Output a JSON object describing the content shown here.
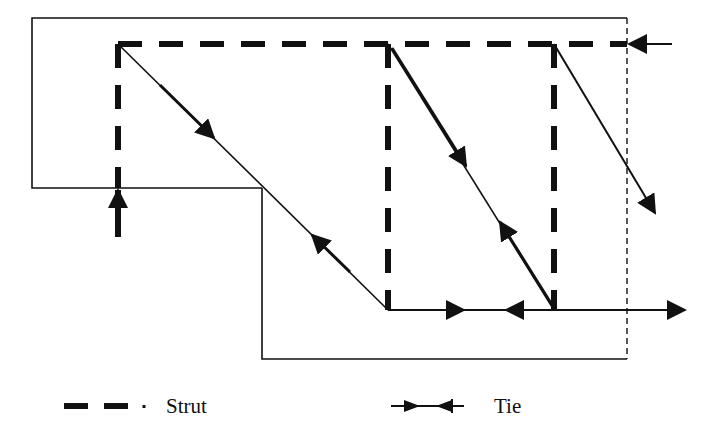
{
  "diagram": {
    "type": "strut-and-tie model",
    "colors": {
      "line": "#111111",
      "background": "#ffffff"
    },
    "outline": {
      "upper_block": {
        "x1": 32,
        "y1": 18,
        "x2": 627,
        "y2": 188
      },
      "lower_block": {
        "x1": 262,
        "y1": 188,
        "x2": 627,
        "y2": 359
      },
      "cut_edge": {
        "x": 627,
        "style": "dashed"
      }
    },
    "struts": [
      {
        "name": "top-horizontal-strut",
        "x1": 118,
        "y1": 44,
        "x2": 627,
        "y2": 44
      },
      {
        "name": "left-vertical-strut",
        "x1": 118,
        "y1": 44,
        "x2": 118,
        "y2": 188
      },
      {
        "name": "middle-vertical-strut",
        "x1": 388,
        "y1": 44,
        "x2": 388,
        "y2": 310
      },
      {
        "name": "right-vertical-strut",
        "x1": 554,
        "y1": 44,
        "x2": 554,
        "y2": 310
      }
    ],
    "ties": [
      {
        "name": "diagonal-tie-1",
        "x1": 118,
        "y1": 44,
        "x2": 388,
        "y2": 310
      },
      {
        "name": "diagonal-tie-2",
        "x1": 388,
        "y1": 44,
        "x2": 554,
        "y2": 310
      },
      {
        "name": "diagonal-tie-3",
        "x1": 554,
        "y1": 44,
        "x2": 655,
        "y2": 213
      },
      {
        "name": "bottom-tie",
        "x1": 388,
        "y1": 310,
        "x2": 685,
        "y2": 310
      }
    ],
    "reactions": [
      {
        "name": "support-reaction-up",
        "x": 118,
        "from_y": 236,
        "to_y": 190
      },
      {
        "name": "horizontal-reaction-left",
        "y": 44,
        "from_x": 672,
        "to_x": 630
      }
    ]
  },
  "legend": {
    "strut_label": "Strut",
    "tie_label": "Tie"
  }
}
